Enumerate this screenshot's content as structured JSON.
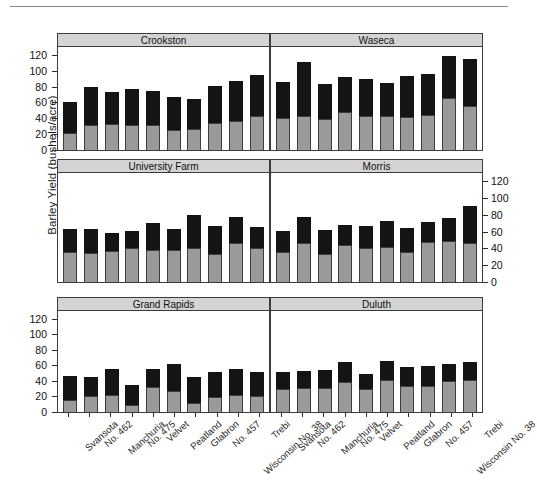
{
  "figure": {
    "ylabel": "Barley Yield (bushels/acre)",
    "bar_colors": {
      "lower": "#9a9a9a",
      "upper": "#141414"
    },
    "panel_strip_color": "#d4d4d4"
  },
  "axes": {
    "ylim": [
      0,
      130
    ],
    "yticks": [
      0,
      20,
      40,
      60,
      80,
      100,
      120
    ],
    "ytick_labels": [
      "0",
      "20",
      "40",
      "60",
      "80",
      "100",
      "120"
    ],
    "grid": false,
    "legend": "none"
  },
  "chart_data": {
    "type": "bar",
    "title": "",
    "xlabel": "",
    "ylabel": "Barley Yield (bushels/acre)",
    "ylim": [
      0,
      130
    ],
    "yticks": [
      0,
      20,
      40,
      60,
      80,
      100,
      120
    ],
    "stacked": true,
    "categories": [
      "Svansota",
      "No. 462",
      "Manchuria",
      "No. 475",
      "Velvet",
      "Peatland",
      "Glabron",
      "No. 457",
      "Wisconsin No. 38",
      "Trebi"
    ],
    "series": [
      {
        "name": "lower-segment",
        "color": "#9a9a9a"
      },
      {
        "name": "upper-segment",
        "color": "#141414"
      }
    ],
    "panels": [
      {
        "name": "Crookston",
        "row": 0,
        "col": 0,
        "lower": [
          21,
          31,
          33,
          32,
          32,
          25,
          26,
          34,
          36,
          43
        ],
        "upper": [
          40,
          49,
          40,
          45,
          42,
          42,
          39,
          47,
          51,
          52
        ],
        "total": [
          61,
          80,
          73,
          77,
          74,
          67,
          65,
          81,
          87,
          95
        ]
      },
      {
        "name": "Waseca",
        "row": 0,
        "col": 1,
        "lower": [
          41,
          43,
          39,
          48,
          43,
          43,
          42,
          44,
          66,
          55
        ],
        "upper": [
          45,
          68,
          44,
          44,
          47,
          42,
          51,
          52,
          53,
          60
        ],
        "total": [
          86,
          111,
          83,
          92,
          90,
          85,
          93,
          96,
          119,
          115
        ]
      },
      {
        "name": "University Farm",
        "row": 1,
        "col": 0,
        "lower": [
          36,
          35,
          37,
          40,
          38,
          38,
          40,
          33,
          46,
          40
        ],
        "upper": [
          27,
          28,
          22,
          21,
          32,
          25,
          40,
          34,
          32,
          26
        ],
        "total": [
          63,
          63,
          59,
          61,
          70,
          63,
          80,
          67,
          78,
          66
        ]
      },
      {
        "name": "Morris",
        "row": 1,
        "col": 1,
        "lower": [
          36,
          47,
          34,
          44,
          40,
          42,
          36,
          48,
          49,
          46
        ],
        "upper": [
          25,
          30,
          28,
          24,
          27,
          31,
          29,
          24,
          27,
          45
        ],
        "total": [
          61,
          77,
          62,
          68,
          67,
          73,
          65,
          72,
          76,
          91
        ]
      },
      {
        "name": "Grand Rapids",
        "row": 2,
        "col": 0,
        "lower": [
          16,
          20,
          22,
          9,
          32,
          27,
          12,
          19,
          22,
          21
        ],
        "upper": [
          30,
          25,
          33,
          26,
          23,
          35,
          33,
          33,
          34,
          31
        ],
        "total": [
          46,
          45,
          55,
          35,
          55,
          62,
          45,
          52,
          56,
          52
        ]
      },
      {
        "name": "Duluth",
        "row": 2,
        "col": 1,
        "lower": [
          30,
          31,
          31,
          38,
          30,
          41,
          33,
          33,
          40,
          41
        ],
        "upper": [
          21,
          22,
          23,
          27,
          19,
          25,
          25,
          26,
          22,
          23
        ],
        "total": [
          51,
          53,
          54,
          65,
          49,
          66,
          58,
          59,
          62,
          64
        ]
      }
    ]
  }
}
